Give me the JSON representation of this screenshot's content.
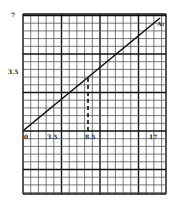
{
  "chart_data": {
    "type": "line",
    "title": "",
    "xlabel": "",
    "ylabel": "",
    "x_ticks": [
      "0",
      "3.5",
      "8.5",
      "17"
    ],
    "y_ticks": [
      "3.5",
      "7"
    ],
    "series": [
      {
        "name": "A1",
        "label": "A₁",
        "x": [
          0,
          17.8
        ],
        "y": [
          0,
          7.5
        ]
      }
    ],
    "annotations": [
      {
        "type": "dashed-vertical",
        "x": 8.5,
        "y_from": 0,
        "y_to": 3.6
      }
    ],
    "grid": true,
    "legend": "none",
    "xlim": [
      0,
      18.5
    ],
    "ylim": [
      -4,
      8
    ]
  },
  "colors": {
    "grid_minor": "#555555",
    "grid_major": "#111111",
    "line": "#111111",
    "background": "#ffffff"
  },
  "labels": {
    "origin": "0",
    "x1": "3.5",
    "x2": "8.5",
    "x3": "17",
    "y1": "3.5",
    "y2": "7",
    "series": "A₁"
  }
}
